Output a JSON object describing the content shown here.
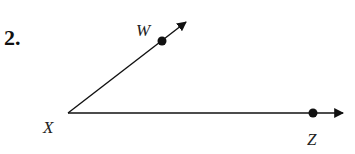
{
  "problem": {
    "number": "2."
  },
  "diagram": {
    "type": "angle",
    "vertex": {
      "label": "X",
      "x": 68,
      "y": 113
    },
    "rays": [
      {
        "name": "ray-XW",
        "point_label": "W",
        "point": {
          "x": 162,
          "y": 41
        },
        "arrow_tip": {
          "x": 188,
          "y": 21
        }
      },
      {
        "name": "ray-XZ",
        "point_label": "Z",
        "point": {
          "x": 313,
          "y": 113
        },
        "arrow_tip": {
          "x": 344,
          "y": 113
        }
      }
    ],
    "labels": {
      "W": "W",
      "X": "X",
      "Z": "Z"
    },
    "colors": {
      "stroke": "#111111"
    }
  }
}
